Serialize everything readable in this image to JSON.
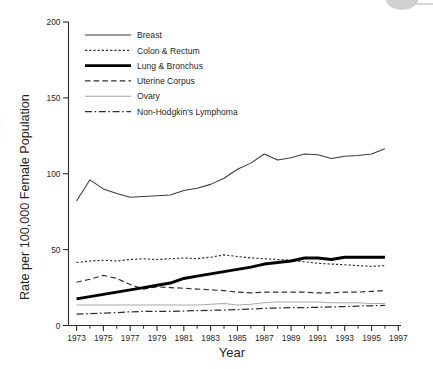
{
  "chart_data": {
    "type": "line",
    "title": "",
    "xlabel": "Year",
    "ylabel": "Rate per 100,000 Female Population",
    "xlim": [
      1972.4,
      1997.2
    ],
    "ylim": [
      0,
      200
    ],
    "yticks": [
      0,
      50,
      100,
      150,
      200
    ],
    "ytick_labels": [
      "0",
      "50",
      "100",
      "150",
      "200"
    ],
    "xticks": [
      1973,
      1975,
      1977,
      1979,
      1981,
      1983,
      1985,
      1987,
      1989,
      1991,
      1993,
      1995,
      1997
    ],
    "xtick_labels": [
      "1973",
      "1975",
      "1977",
      "1979",
      "1981",
      "1983",
      "1985",
      "1987",
      "1989",
      "1991",
      "1993",
      "1995",
      "1997"
    ],
    "xminor_ticks": [
      1974,
      1976,
      1978,
      1980,
      1982,
      1984,
      1986,
      1988,
      1990,
      1992,
      1994,
      1996
    ],
    "grid": false,
    "legend_position": "upper-left-inside",
    "x": [
      1973,
      1974,
      1975,
      1976,
      1977,
      1978,
      1979,
      1980,
      1981,
      1982,
      1983,
      1984,
      1985,
      1986,
      1987,
      1988,
      1989,
      1990,
      1991,
      1992,
      1993,
      1994,
      1995,
      1996
    ],
    "series": [
      {
        "name": "Breast",
        "style": "solid-thin",
        "color": "#3a3a3a",
        "values": [
          82.0,
          96.0,
          90.0,
          87.0,
          84.5,
          85.0,
          85.5,
          86.0,
          89.0,
          90.5,
          93.0,
          97.0,
          103.0,
          107.0,
          113.0,
          109.0,
          110.5,
          113.0,
          112.5,
          110.0,
          111.5,
          112.0,
          113.0,
          116.5
        ]
      },
      {
        "name": "Colon & Rectum",
        "style": "dotted",
        "color": "#2e2e2e",
        "values": [
          41.5,
          42.5,
          43.0,
          42.5,
          43.5,
          44.0,
          43.5,
          44.0,
          44.5,
          44.0,
          45.0,
          46.5,
          45.5,
          44.5,
          44.0,
          43.5,
          43.0,
          42.0,
          41.0,
          40.5,
          40.0,
          39.5,
          39.0,
          39.5
        ]
      },
      {
        "name": "Lung & Bronchus",
        "style": "solid-thick",
        "color": "#000000",
        "values": [
          17.5,
          19.0,
          20.5,
          22.0,
          23.5,
          25.0,
          26.5,
          28.0,
          31.0,
          32.5,
          34.0,
          35.5,
          37.0,
          38.5,
          40.5,
          41.5,
          42.5,
          44.5,
          44.5,
          43.5,
          45.0,
          45.0,
          45.0,
          45.0
        ]
      },
      {
        "name": "Uterine Corpus",
        "style": "dashed",
        "color": "#2e2e2e",
        "values": [
          28.5,
          30.5,
          33.0,
          31.0,
          27.0,
          24.0,
          25.5,
          25.0,
          24.5,
          24.0,
          23.5,
          23.0,
          22.0,
          21.5,
          22.0,
          22.0,
          22.0,
          22.0,
          21.5,
          21.5,
          22.0,
          22.0,
          22.5,
          23.0
        ]
      },
      {
        "name": "Ovary",
        "style": "solid-gray",
        "color": "#a8a8a8",
        "values": [
          13.5,
          13.5,
          13.5,
          13.5,
          13.5,
          13.5,
          13.5,
          13.5,
          13.5,
          13.5,
          14.0,
          14.5,
          13.5,
          14.0,
          15.0,
          15.5,
          15.5,
          15.5,
          15.5,
          15.0,
          15.0,
          15.0,
          14.5,
          14.5
        ]
      },
      {
        "name": "Non-Hodgkin's Lymphoma",
        "style": "dash-dot",
        "color": "#2e2e2e",
        "values": [
          7.5,
          7.8,
          8.2,
          8.5,
          9.0,
          9.3,
          9.3,
          9.3,
          9.5,
          9.8,
          10.0,
          10.2,
          10.5,
          10.8,
          11.3,
          11.5,
          11.8,
          11.8,
          12.0,
          12.2,
          12.5,
          12.8,
          13.0,
          13.2
        ]
      }
    ]
  },
  "legend": {
    "entries": [
      {
        "label": "Breast",
        "key": "solid-thin"
      },
      {
        "label": "Colon & Rectum",
        "key": "dotted"
      },
      {
        "label": "Lung & Bronchus",
        "key": "solid-thick"
      },
      {
        "label": "Uterine Corpus",
        "key": "dashed"
      },
      {
        "label": "Ovary",
        "key": "solid-gray"
      },
      {
        "label": "Non-Hodgkin's Lymphoma",
        "key": "dash-dot"
      }
    ]
  }
}
